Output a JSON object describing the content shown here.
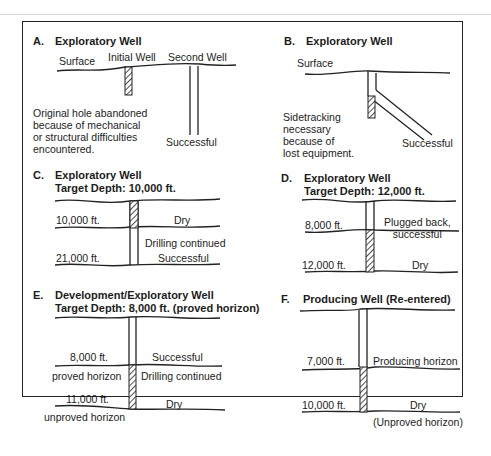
{
  "panels": {
    "A": {
      "letter": "A.",
      "title": "Exploratory Well",
      "surface": "Surface",
      "initial_well": "Initial Well",
      "second_well": "Second Well",
      "note": "Original hole abandoned\nbecause of mechanical\nor structural difficulties\nencountered.",
      "result": "Successful"
    },
    "B": {
      "letter": "B.",
      "title": "Exploratory Well",
      "surface": "Surface",
      "note": "Sidetracking\nnecessary\nbecause of\nlost equipment.",
      "result": "Successful"
    },
    "C": {
      "letter": "C.",
      "title": "Exploratory Well",
      "subtitle": "Target Depth: 10,000 ft.",
      "depth1": "10,000 ft.",
      "label1": "Dry",
      "label2": "Drilling continued",
      "depth2": "21,000 ft.",
      "label3": "Successful"
    },
    "D": {
      "letter": "D.",
      "title": "Exploratory Well",
      "subtitle": "Target Depth: 12,000 ft.",
      "depth1": "8,000 ft.",
      "label1": "Plugged back,\nsuccessful",
      "depth2": "12,000 ft.",
      "label2": "Dry"
    },
    "E": {
      "letter": "E.",
      "title": "Development/Exploratory Well",
      "subtitle": "Target Depth: 8,000 ft. (proved horizon)",
      "depth1": "8,000 ft.",
      "horizon1": "proved horizon",
      "label1": "Successful",
      "label2": "Drilling continued",
      "depth2": "11,000 ft.",
      "horizon2": "unproved horizon",
      "label3": "Dry"
    },
    "F": {
      "letter": "F.",
      "title": "Producing Well (Re-entered)",
      "depth1": "7,000 ft.",
      "label1": "Producing horizon",
      "depth2": "10,000 ft.",
      "label2": "Dry",
      "label3": "(Unproved horizon)"
    }
  }
}
